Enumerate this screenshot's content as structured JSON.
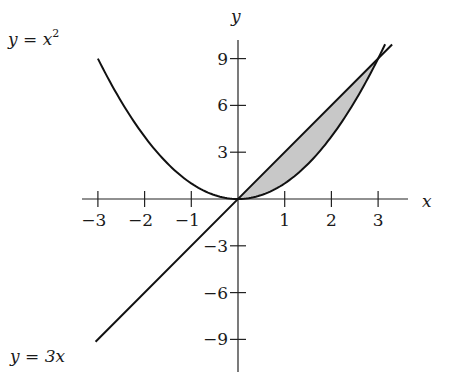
{
  "chart_data": {
    "type": "line",
    "title": "",
    "xlabel": "x",
    "ylabel": "y",
    "xlim": [
      -3.3,
      3.7
    ],
    "ylim": [
      -10.5,
      10.5
    ],
    "grid": false,
    "x_ticks": [
      -3,
      -2,
      -1,
      1,
      2,
      3
    ],
    "x_tick_labels": [
      "−3",
      "−2",
      "−1",
      "1",
      "2",
      "3"
    ],
    "y_ticks": [
      9,
      6,
      3,
      -3,
      -6,
      -9
    ],
    "y_tick_labels": [
      "9",
      "6",
      "3",
      "−3",
      "−6",
      "−9"
    ],
    "series": [
      {
        "name": "y = x²",
        "expression": "x^2",
        "x_range": [
          -3,
          3.15
        ]
      },
      {
        "name": "y = 3x",
        "expression": "3x",
        "x_range": [
          -3.05,
          3.3
        ]
      }
    ],
    "shaded_region": {
      "between": [
        "y = 3x",
        "y = x²"
      ],
      "x_range": [
        0,
        3
      ],
      "fill": "#c8c8c8"
    },
    "intersections": [
      [
        0,
        0
      ],
      [
        3,
        9
      ]
    ],
    "annotations": [
      {
        "text": "y = x²",
        "position": "top-left"
      },
      {
        "text": "y = 3x",
        "position": "bottom-left"
      }
    ]
  },
  "labels": {
    "x_axis": "x",
    "y_axis": "y",
    "curve_parabola": "y = x",
    "curve_parabola_exp": "2",
    "curve_line": "y = 3x"
  }
}
